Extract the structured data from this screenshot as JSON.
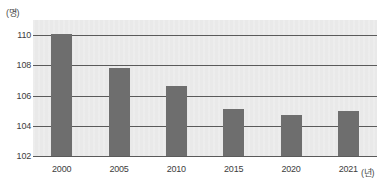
{
  "chart_data": {
    "type": "bar",
    "title": "",
    "subtitle": "",
    "xlabel": "(년)",
    "ylabel": "(명)",
    "categories": [
      "2000",
      "2005",
      "2010",
      "2015",
      "2020",
      "2021"
    ],
    "values": [
      110.1,
      107.8,
      106.6,
      105.1,
      104.7,
      105.0
    ],
    "series": [
      {
        "name": "",
        "values": [
          110.1,
          107.8,
          106.6,
          105.1,
          104.7,
          105.0
        ]
      }
    ],
    "ylim": [
      102,
      111
    ],
    "yticks": [
      102,
      104,
      106,
      108,
      110
    ],
    "ytick_labels": [
      "102",
      "104",
      "106",
      "108",
      "110"
    ],
    "grid": true,
    "legend": false,
    "legend_position": "none",
    "bar_color": "#6e6e6e",
    "plot_background": "#e9e9e9",
    "gridline_color": "#5a5a5a",
    "axis_text_color": "#3d3d3d"
  }
}
